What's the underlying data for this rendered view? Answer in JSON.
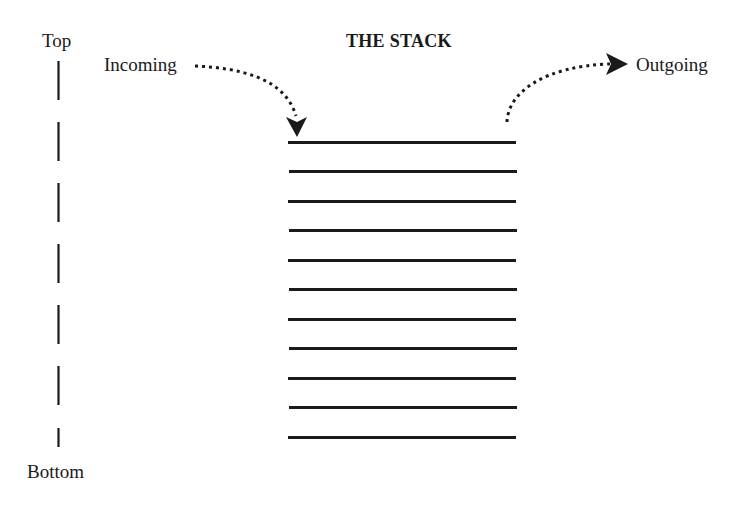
{
  "diagram": {
    "title": "THE STACK",
    "axis": {
      "top_label": "Top",
      "bottom_label": "Bottom"
    },
    "flows": {
      "incoming_label": "Incoming",
      "outgoing_label": "Outgoing"
    },
    "stack": {
      "item_count": 11,
      "line_color": "#1a1a1a"
    }
  }
}
